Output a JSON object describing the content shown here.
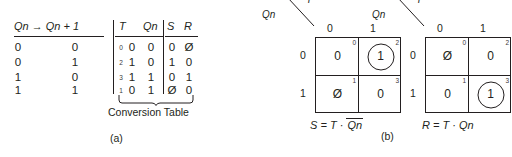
{
  "figure": {
    "panel_a_caption": "(a)",
    "panel_b_caption": "(b)"
  },
  "table": {
    "title_label": "Conversion Table",
    "headers": {
      "transition": "Qn → Qn + 1",
      "t": "T",
      "qn": "Qn",
      "s": "S",
      "r": "R"
    },
    "rows": [
      {
        "qn_now": "0",
        "qn_next": "0",
        "index": "0",
        "t": "0",
        "qn": "0",
        "s": "0",
        "r": "Ø",
        "s_dontcare": false,
        "r_dontcare": true
      },
      {
        "qn_now": "0",
        "qn_next": "1",
        "index": "2",
        "t": "1",
        "qn": "0",
        "s": "1",
        "r": "0",
        "s_dontcare": false,
        "r_dontcare": false
      },
      {
        "qn_now": "1",
        "qn_next": "0",
        "index": "3",
        "t": "1",
        "qn": "1",
        "s": "0",
        "r": "1",
        "s_dontcare": false,
        "r_dontcare": false
      },
      {
        "qn_now": "1",
        "qn_next": "1",
        "index": "1",
        "t": "0",
        "qn": "1",
        "s": "Ø",
        "r": "0",
        "s_dontcare": true,
        "r_dontcare": false
      }
    ]
  },
  "kmaps": [
    {
      "name": "S",
      "corner_top_var": "T",
      "corner_side_var": "Qn",
      "col_labels": [
        "0",
        "1"
      ],
      "row_labels": [
        "0",
        "1"
      ],
      "cells": [
        {
          "index": "0",
          "value": "0",
          "circled": false,
          "dontcare": false
        },
        {
          "index": "2",
          "value": "1",
          "circled": true,
          "dontcare": false
        },
        {
          "index": "1",
          "value": "Ø",
          "circled": false,
          "dontcare": true
        },
        {
          "index": "3",
          "value": "0",
          "circled": false,
          "dontcare": false
        }
      ],
      "equation_lhs": "S",
      "equation_op": "=",
      "equation_term1": "T",
      "equation_dot": "·",
      "equation_term2": "Qn",
      "equation_term2_overbar": true
    },
    {
      "name": "R",
      "corner_top_var": "T",
      "corner_side_var": "Qn",
      "col_labels": [
        "0",
        "1"
      ],
      "row_labels": [
        "0",
        "1"
      ],
      "cells": [
        {
          "index": "0",
          "value": "Ø",
          "circled": false,
          "dontcare": true
        },
        {
          "index": "2",
          "value": "0",
          "circled": false,
          "dontcare": false
        },
        {
          "index": "1",
          "value": "0",
          "circled": false,
          "dontcare": false
        },
        {
          "index": "3",
          "value": "1",
          "circled": true,
          "dontcare": false
        }
      ],
      "equation_lhs": "R",
      "equation_op": "=",
      "equation_term1": "T",
      "equation_dot": "·",
      "equation_term2": "Qn",
      "equation_term2_overbar": false
    }
  ]
}
